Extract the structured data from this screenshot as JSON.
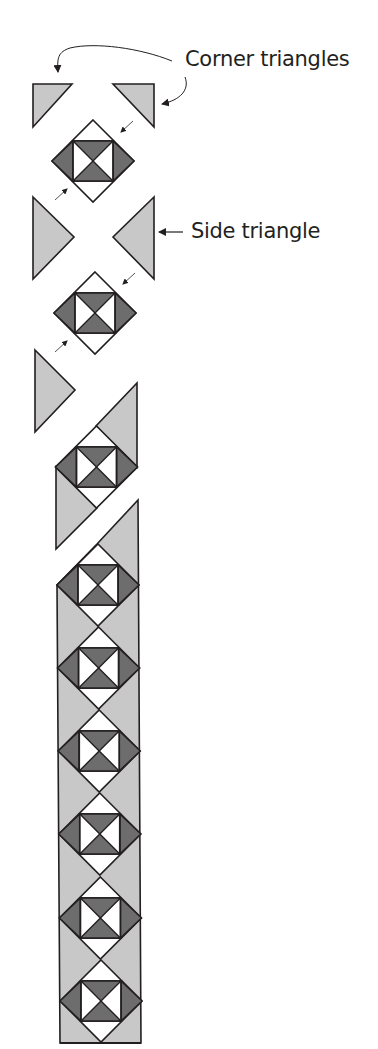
{
  "diagram": {
    "labels": {
      "corner": "Corner triangles",
      "side": "Side triangle"
    },
    "colors": {
      "setting_triangle": "#c8c8c8",
      "block_dark": "#6d6d6d",
      "block_light": "#ffffff",
      "outline": "#231f20"
    },
    "steps": [
      {
        "name": "corner-triangles-and-first-block",
        "pieces": [
          "corner-triangle-left",
          "corner-triangle-right",
          "block-1"
        ]
      },
      {
        "name": "side-triangles-and-second-block",
        "pieces": [
          "side-triangle-left",
          "side-triangle-right",
          "block-2"
        ]
      },
      {
        "name": "side-triangle-left-only",
        "pieces": [
          "side-triangle-left"
        ]
      },
      {
        "name": "joined-single-block-segment",
        "pieces": [
          "block-3"
        ]
      },
      {
        "name": "completed-row",
        "block_count": 6
      }
    ]
  }
}
